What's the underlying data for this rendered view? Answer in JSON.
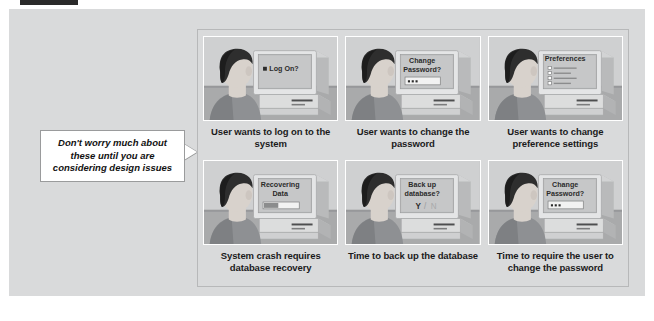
{
  "figure": {
    "background_color": "#d9dadb",
    "panel_border_color": "#b7b8b9"
  },
  "callout": {
    "text": "Don't worry much about these until you are considering design issues",
    "background_color": "#ffffff",
    "border_color": "#9a9b9c"
  },
  "cells": [
    {
      "caption": "User wants to log on to the system",
      "screen_lines": [
        "Log On?"
      ],
      "screen_widget": "bullet",
      "widget_label": ""
    },
    {
      "caption": "User wants to change the password",
      "screen_lines": [
        "Change",
        "Password?"
      ],
      "screen_widget": "password-field",
      "widget_label": ""
    },
    {
      "caption": "User wants to change preference settings",
      "screen_lines": [
        "Preferences"
      ],
      "screen_widget": "checklist",
      "widget_label": ""
    },
    {
      "caption": "System crash requires database recovery",
      "screen_lines": [
        "Recovering",
        "Data"
      ],
      "screen_widget": "progress-bar",
      "widget_label": ""
    },
    {
      "caption": "Time to back up the database",
      "screen_lines": [
        "Back up",
        "database?"
      ],
      "screen_widget": "yes-no",
      "widget_label": "Y / N"
    },
    {
      "caption": "Time to require the user to change the password",
      "screen_lines": [
        "Change",
        "Password?"
      ],
      "screen_widget": "password-field",
      "widget_label": ""
    }
  ],
  "illustration": {
    "hair_color": "#2e2e2e",
    "skin_color": "#d8d2cc",
    "shirt_color": "#8e9093",
    "monitor_color": "#e4e5e6",
    "screen_color": "#bcbdbe",
    "wall_color": "#cfd0d1",
    "desk_color": "#a9aaab"
  }
}
